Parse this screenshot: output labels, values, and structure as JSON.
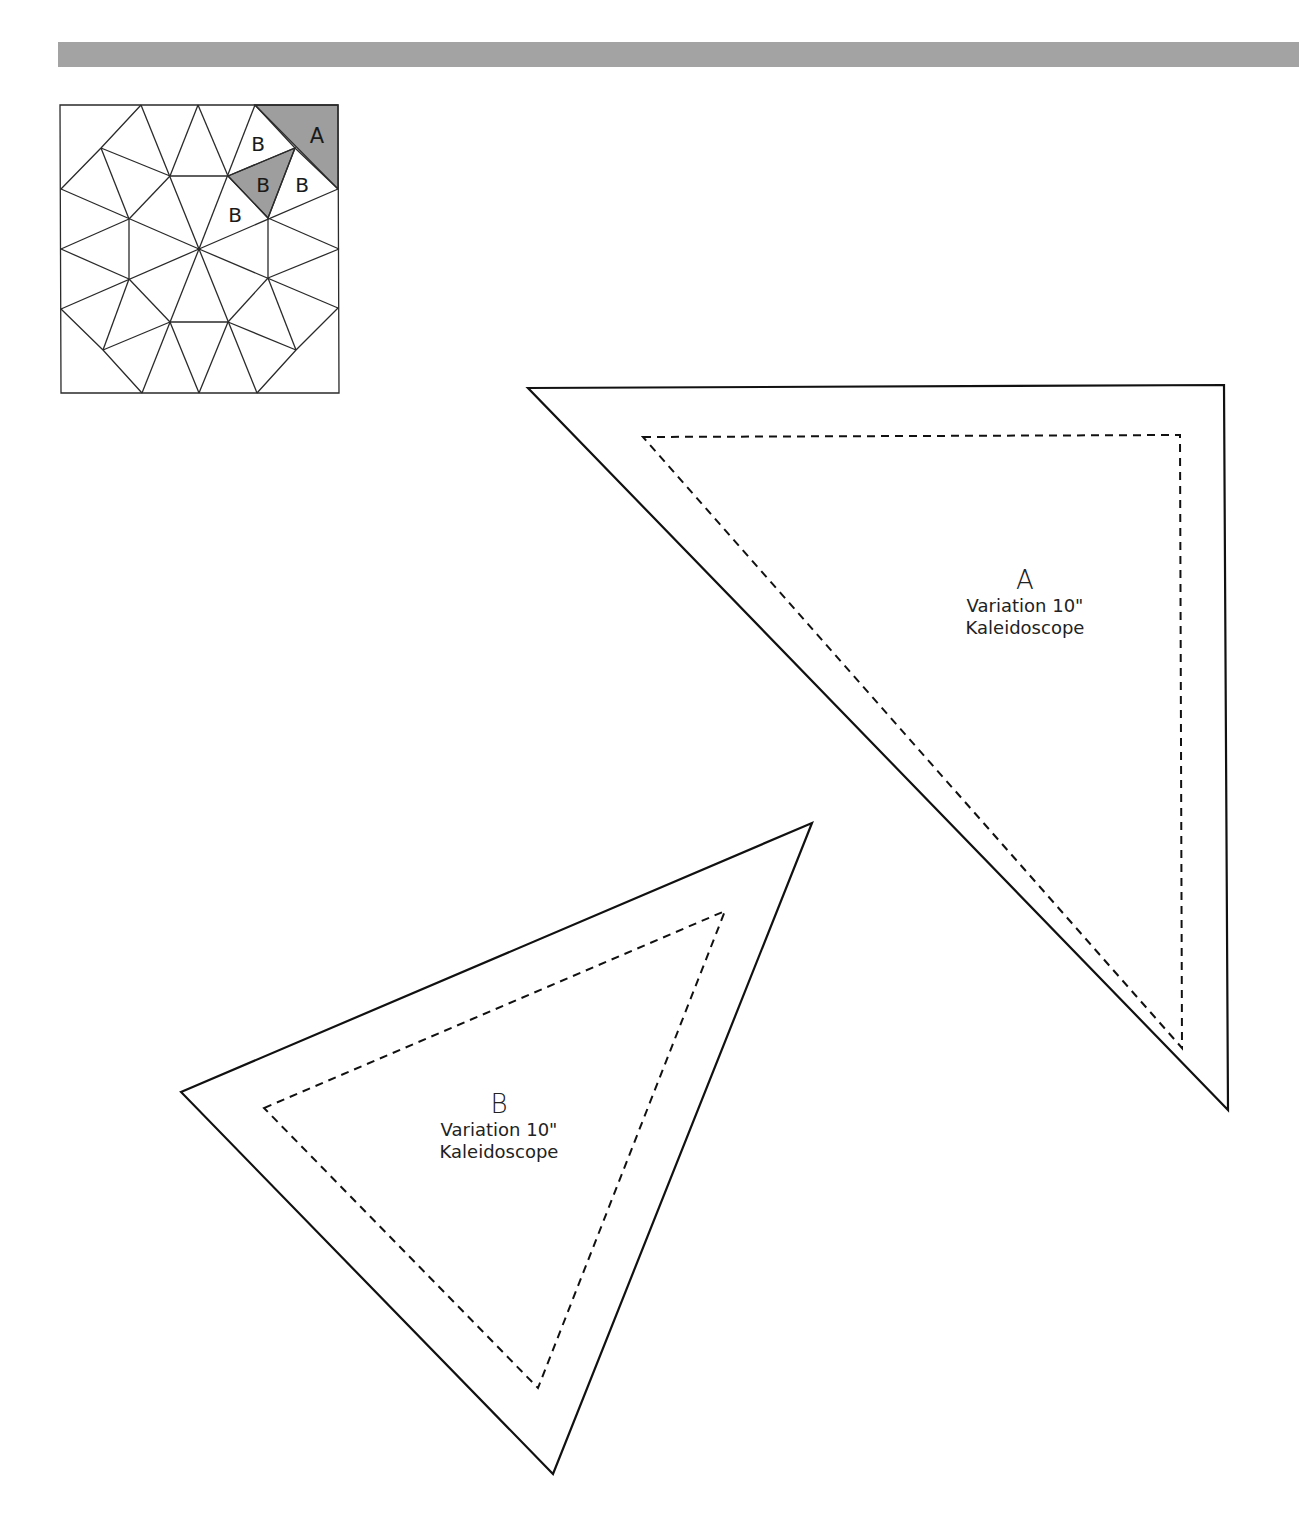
{
  "header": {
    "bar_color": "#a3a3a3"
  },
  "block_diagram": {
    "name": "Variation 10\" Kaleidoscope block",
    "shade_color": "#9e9e9e",
    "labels": [
      {
        "text": "A",
        "shaded": true
      },
      {
        "text": "B",
        "shaded": false
      },
      {
        "text": "B",
        "shaded": true
      },
      {
        "text": "B",
        "shaded": false
      },
      {
        "text": "B",
        "shaded": false
      }
    ]
  },
  "templates": [
    {
      "letter": "A",
      "line1": "Variation 10\"",
      "line2": "Kaleidoscope"
    },
    {
      "letter": "B",
      "line1": "Variation 10\"",
      "line2": "Kaleidoscope"
    }
  ]
}
